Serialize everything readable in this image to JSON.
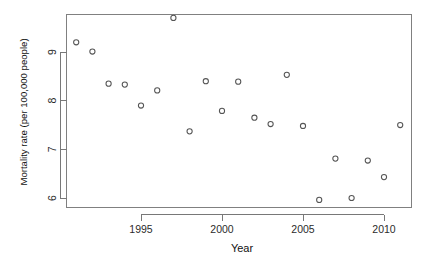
{
  "chart_data": {
    "type": "scatter",
    "title": "",
    "xlabel": "Year",
    "ylabel": "Mortality rate (per 100,000 people)",
    "xlim": [
      1990.2,
      2011.6
    ],
    "ylim": [
      5.7,
      9.95
    ],
    "grid": false,
    "legend": null,
    "point_marker": "open-circle",
    "point_color": "#555555",
    "x": [
      1991,
      1992,
      1993,
      1994,
      1995,
      1996,
      1997,
      1998,
      1999,
      2000,
      2001,
      2002,
      2003,
      2004,
      2005,
      2006,
      2007,
      2008,
      2009,
      2010,
      2011
    ],
    "y": [
      9.2,
      9.01,
      8.35,
      8.33,
      7.9,
      8.21,
      9.7,
      7.37,
      8.4,
      7.79,
      8.39,
      7.65,
      7.52,
      8.53,
      7.48,
      5.96,
      6.81,
      6.0,
      6.77,
      6.43,
      7.5
    ],
    "xticks": [
      1995,
      2000,
      2005,
      2010
    ],
    "xtick_labels": [
      "1995",
      "2000",
      "2005",
      "2010"
    ],
    "yticks": [
      6,
      7,
      8,
      9
    ],
    "ytick_labels": [
      "6",
      "7",
      "8",
      "9"
    ]
  },
  "axes": {
    "x_title": "Year",
    "y_title": "Mortality rate (per 100,000 people)"
  }
}
